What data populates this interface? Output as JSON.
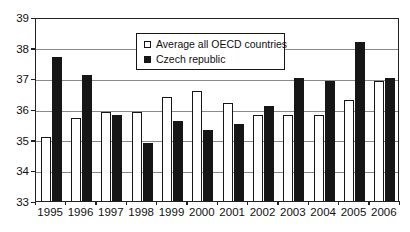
{
  "chart_data": {
    "type": "bar",
    "title": "",
    "xlabel": "",
    "ylabel": "",
    "categories": [
      "1995",
      "1996",
      "1997",
      "1998",
      "1999",
      "2000",
      "2001",
      "2002",
      "2003",
      "2004",
      "2005",
      "2006"
    ],
    "series": [
      {
        "name": "Average all OECD countries",
        "key": "oecd",
        "fill": "#ffffff",
        "values": [
          35.1,
          35.7,
          35.9,
          35.9,
          36.4,
          36.6,
          36.2,
          35.8,
          35.8,
          35.8,
          36.3,
          36.9
        ]
      },
      {
        "name": "Czech republic",
        "key": "czech",
        "fill": "#161616",
        "values": [
          37.7,
          37.1,
          35.8,
          34.9,
          35.6,
          35.3,
          35.5,
          36.1,
          37.0,
          36.9,
          38.2,
          37.0
        ]
      }
    ],
    "ylim": [
      33,
      39
    ],
    "yticks": [
      33,
      34,
      35,
      36,
      37,
      38,
      39
    ],
    "grid": true,
    "legend_position": "top-center-inside",
    "colors": {
      "grid": "#8a8a8a",
      "axis": "#222222",
      "background": "#ffffff",
      "text": "#111111"
    }
  }
}
